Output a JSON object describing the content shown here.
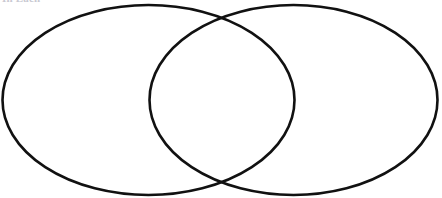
{
  "page": {
    "width": 442,
    "height": 198,
    "background_color": "#ffffff"
  },
  "clipped_caption": {
    "text": "In Each",
    "color": "#c9c9d2",
    "note": "bottom sliver of a cut-off text line at top-left, barely legible"
  },
  "diagram": {
    "type": "venn",
    "set_count": 2,
    "stroke_color": "#111111",
    "stroke_width": 2.6,
    "fill": "none",
    "left_circle": {
      "label": "",
      "cx": 148.5,
      "cy": 100,
      "rx": 146,
      "ry": 95
    },
    "right_circle": {
      "label": "",
      "cx": 293.5,
      "cy": 100,
      "rx": 144,
      "ry": 95
    },
    "intersection_points": [
      {
        "x": 222,
        "y": 19
      },
      {
        "x": 222,
        "y": 182
      }
    ],
    "region_labels": {
      "left_only": "",
      "overlap": "",
      "right_only": ""
    }
  }
}
